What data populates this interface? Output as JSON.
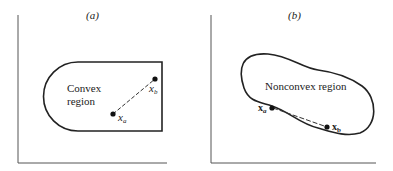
{
  "panels": [
    {
      "id": "a",
      "title": "(a)",
      "region_label_line1": "Convex",
      "region_label_line2": "region",
      "point_a_label": "x",
      "point_a_sub": "a",
      "point_b_label": "x",
      "point_b_sub": "b"
    },
    {
      "id": "b",
      "title": "(b)",
      "region_label": "Nonconvex region",
      "point_a_label": "x",
      "point_a_sub": "a",
      "point_b_label": "x",
      "point_b_sub": "b"
    }
  ],
  "colors": {
    "stroke": "#222222",
    "background": "#ffffff"
  }
}
